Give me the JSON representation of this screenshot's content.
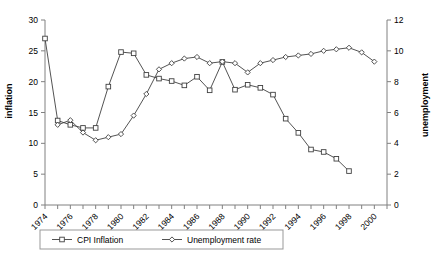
{
  "chart_data": {
    "type": "line",
    "title": "",
    "xlabel": "",
    "ylabel": "inflation",
    "ylabel_right": "unemployment",
    "ylim": [
      0,
      30
    ],
    "ylim_right": [
      0,
      12
    ],
    "xlim": [
      1974,
      2001
    ],
    "grid": false,
    "legend_position": "bottom",
    "yticks": [
      0,
      5,
      10,
      15,
      20,
      25,
      30
    ],
    "yticks_right": [
      0,
      2,
      4,
      6,
      8,
      10,
      12
    ],
    "xticks": [
      1974,
      1975,
      1976,
      1977,
      1978,
      1979,
      1980,
      1981,
      1982,
      1983,
      1984,
      1985,
      1986,
      1987,
      1988,
      1989,
      1990,
      1991,
      1992,
      1993,
      1994,
      1995,
      1996,
      1997,
      1998,
      1999,
      2000,
      2001
    ],
    "xtick_labels": [
      "1974",
      "",
      "1976",
      "",
      "1978",
      "",
      "1980",
      "",
      "1982",
      "",
      "1984",
      "",
      "1986",
      "",
      "1988",
      "",
      "1990",
      "",
      "1992",
      "",
      "1994",
      "",
      "1996",
      "",
      "1998",
      "",
      "2000",
      ""
    ],
    "x": [
      1974,
      1975,
      1976,
      1977,
      1978,
      1979,
      1980,
      1981,
      1982,
      1983,
      1984,
      1985,
      1986,
      1987,
      1988,
      1989,
      1990,
      1991,
      1992,
      1993,
      1994,
      1995,
      1996,
      1997,
      1998,
      1999,
      2000
    ],
    "series": [
      {
        "name": "CPI Inflation",
        "axis": "left",
        "marker": "square",
        "x": [
          1974,
          1975,
          1976,
          1977,
          1978,
          1979,
          1980,
          1981,
          1982,
          1983,
          1984,
          1985,
          1986,
          1987,
          1988,
          1989,
          1990,
          1991,
          1992,
          1993,
          1994,
          1995,
          1996,
          1997,
          1998
        ],
        "values": [
          27.0,
          13.7,
          13.0,
          12.5,
          12.5,
          19.2,
          24.8,
          24.6,
          21.1,
          20.5,
          20.1,
          19.4,
          20.8,
          18.6,
          23.2,
          18.7,
          19.5,
          19.0,
          17.9,
          14.0,
          11.7,
          9.0,
          8.6,
          7.5,
          5.5
        ]
      },
      {
        "name": "Unemployment rate",
        "axis": "right",
        "marker": "diamond",
        "x": [
          1975,
          1976,
          1977,
          1978,
          1979,
          1980,
          1981,
          1982,
          1983,
          1984,
          1985,
          1986,
          1987,
          1988,
          1989,
          1990,
          1991,
          1992,
          1993,
          1994,
          1995,
          1996,
          1997,
          1998,
          1999,
          2000
        ],
        "values": [
          5.2,
          5.5,
          4.7,
          4.2,
          4.4,
          4.6,
          5.8,
          7.2,
          8.8,
          9.2,
          9.5,
          9.6,
          9.2,
          9.3,
          9.2,
          8.6,
          9.2,
          9.4,
          9.6,
          9.7,
          9.8,
          10.0,
          10.1,
          10.2,
          9.9,
          9.3
        ]
      }
    ],
    "legend": [
      "CPI Inflation",
      "Unemployment rate"
    ],
    "colors": {
      "line": "#404040",
      "axis": "#808080",
      "marker_fill": "#ffffff",
      "text": "#000000",
      "legend_border": "#999999"
    }
  }
}
